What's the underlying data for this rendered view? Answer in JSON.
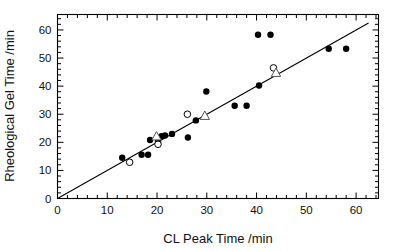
{
  "figure": {
    "background": "#ffffff",
    "frame_color": "#000000",
    "marker_color": "#000000"
  },
  "chart_data": {
    "type": "scatter",
    "title": "",
    "xlabel": "CL Peak Time /min",
    "ylabel": "Rheological Gel Time /min",
    "xlim": [
      0,
      64.5
    ],
    "ylim": [
      0,
      65.5
    ],
    "xticks": [
      0,
      10,
      20,
      30,
      40,
      50,
      60
    ],
    "yticks": [
      0,
      10,
      20,
      30,
      40,
      50,
      60
    ],
    "xtick_labels": [
      "0",
      "10",
      "20",
      "30",
      "40",
      "50",
      "60"
    ],
    "ytick_labels": [
      "0",
      "10",
      "20",
      "30",
      "40",
      "50",
      "60"
    ],
    "minor_tick_step": 2,
    "grid": false,
    "legend": "none",
    "reference_line": {
      "name": "one-to-one-line",
      "type": "line",
      "slope": 1.0,
      "intercept": 0.0,
      "x_start": 0,
      "y_start": 0,
      "x_end": 62.5,
      "y_end": 62.5,
      "color": "#000000",
      "width": 1.1
    },
    "series": [
      {
        "name": "filled-circles",
        "marker": "filled-circle",
        "color": "#000000",
        "size": 4.2,
        "points": [
          [
            13.0,
            14.5
          ],
          [
            16.9,
            15.6
          ],
          [
            18.2,
            15.6
          ],
          [
            18.6,
            20.8
          ],
          [
            20.2,
            20.3
          ],
          [
            20.9,
            22.2
          ],
          [
            21.6,
            22.4
          ],
          [
            23.0,
            23.0
          ],
          [
            26.2,
            21.7
          ],
          [
            27.8,
            27.8
          ],
          [
            29.9,
            38.1
          ],
          [
            35.6,
            33.0
          ],
          [
            38.0,
            33.0
          ],
          [
            40.3,
            58.3
          ],
          [
            40.5,
            40.2
          ],
          [
            42.8,
            58.3
          ],
          [
            54.5,
            53.3
          ],
          [
            58.0,
            53.3
          ]
        ]
      },
      {
        "name": "open-circles",
        "marker": "open-circle",
        "color": "#000000",
        "size": 4.4,
        "points": [
          [
            14.5,
            12.9
          ],
          [
            20.2,
            19.3
          ],
          [
            26.1,
            30.0
          ],
          [
            43.4,
            46.5
          ]
        ]
      },
      {
        "name": "open-triangles",
        "marker": "open-triangle",
        "color": "#555555",
        "size": 5.0,
        "points": [
          [
            19.9,
            22.1
          ],
          [
            29.6,
            29.4
          ],
          [
            43.9,
            44.7
          ]
        ]
      }
    ]
  }
}
